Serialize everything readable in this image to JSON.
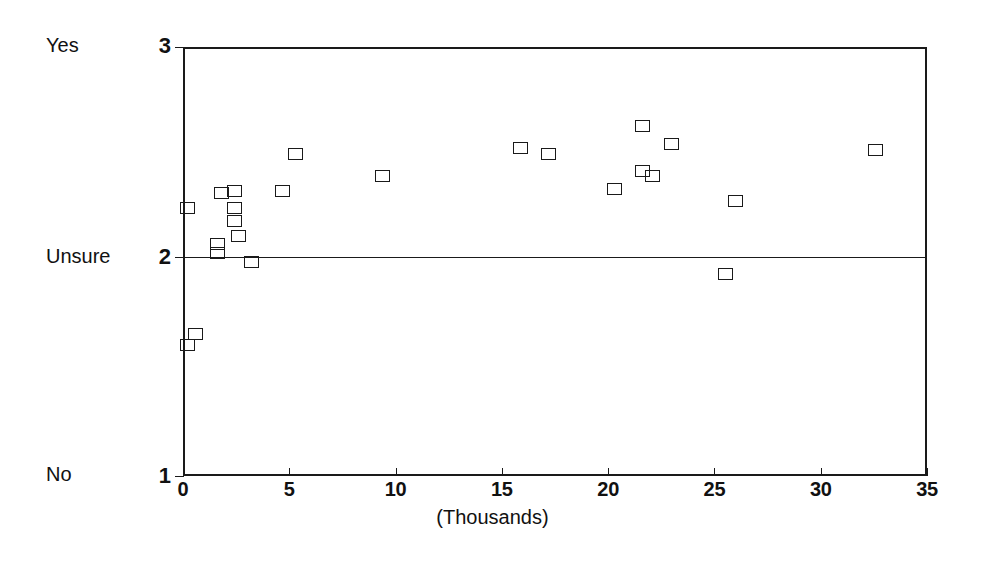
{
  "chart_data": {
    "type": "scatter",
    "title": "",
    "subtitle": "",
    "xlabel": "(Thousands)",
    "ylabel": "",
    "xlim": [
      0,
      35
    ],
    "ylim": [
      1,
      3
    ],
    "grid": false,
    "legend": null,
    "x_ticks": [
      0,
      5,
      10,
      15,
      20,
      25,
      30,
      35
    ],
    "x_tick_labels": [
      "0",
      "5",
      "10",
      "15",
      "20",
      "25",
      "30",
      "35"
    ],
    "y_ticks": [
      1,
      2,
      3
    ],
    "y_tick_labels": [
      "1",
      "2",
      "3"
    ],
    "y_category_labels": [
      {
        "value": 3,
        "label": "Yes"
      },
      {
        "value": 2,
        "label": "Unsure"
      },
      {
        "value": 1,
        "label": "No"
      }
    ],
    "reference_lines": [
      {
        "orientation": "horizontal",
        "value": 2,
        "label": "Unsure"
      }
    ],
    "marker": "open-square",
    "series": [
      {
        "name": "responses",
        "points": [
          {
            "x": 0.2,
            "y": 1.61
          },
          {
            "x": 0.6,
            "y": 1.66
          },
          {
            "x": 0.2,
            "y": 2.25
          },
          {
            "x": 1.6,
            "y": 2.08
          },
          {
            "x": 1.6,
            "y": 2.04
          },
          {
            "x": 1.8,
            "y": 2.32
          },
          {
            "x": 2.4,
            "y": 2.33
          },
          {
            "x": 2.4,
            "y": 2.25
          },
          {
            "x": 2.4,
            "y": 2.19
          },
          {
            "x": 2.6,
            "y": 2.12
          },
          {
            "x": 3.2,
            "y": 2.0
          },
          {
            "x": 4.7,
            "y": 2.33
          },
          {
            "x": 5.3,
            "y": 2.5
          },
          {
            "x": 9.4,
            "y": 2.4
          },
          {
            "x": 15.9,
            "y": 2.53
          },
          {
            "x": 17.2,
            "y": 2.5
          },
          {
            "x": 20.3,
            "y": 2.34
          },
          {
            "x": 21.6,
            "y": 2.63
          },
          {
            "x": 21.6,
            "y": 2.42
          },
          {
            "x": 22.1,
            "y": 2.4
          },
          {
            "x": 23.0,
            "y": 2.55
          },
          {
            "x": 25.5,
            "y": 1.94
          },
          {
            "x": 26.0,
            "y": 2.28
          },
          {
            "x": 32.6,
            "y": 2.52
          }
        ]
      }
    ],
    "colors": {
      "axis": "#1a1a1a",
      "marker_stroke": "#1a1a1a",
      "marker_fill": "none",
      "background": "#ffffff"
    }
  }
}
